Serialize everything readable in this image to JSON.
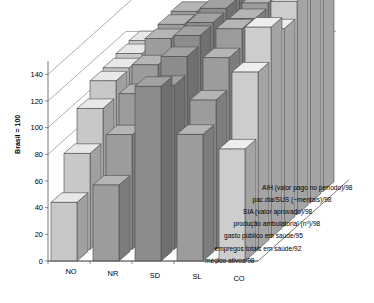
{
  "chart_data": {
    "type": "bar",
    "title": "",
    "subtitle": "",
    "xlabel": "",
    "ylabel": "Brasil = 100",
    "ylim": [
      0,
      150
    ],
    "yticks": [
      0,
      20,
      40,
      60,
      80,
      100,
      120,
      140
    ],
    "grid": true,
    "projection": "3d",
    "legend_position": "right-depth-axis",
    "categories": [
      "NO",
      "NR",
      "SD",
      "SL",
      "CO"
    ],
    "series": [
      {
        "name": "médico ativos/98",
        "values": [
          44,
          57,
          131,
          95,
          84
        ]
      },
      {
        "name": "empregos totais em saúde/92",
        "values": [
          72,
          86,
          123,
          112,
          133
        ]
      },
      {
        "name": "gasto público em saúde/95",
        "values": [
          97,
          108,
          136,
          135,
          158
        ]
      },
      {
        "name": "produção ambulatorial (nº)/98",
        "values": [
          109,
          121,
          143,
          148,
          148
        ]
      },
      {
        "name": "SIA (valor aprovado)/98",
        "values": [
          110,
          132,
          144,
          147,
          160
        ]
      },
      {
        "name": "pac.dia/SUS (~mentais)/98",
        "values": [
          112,
          134,
          146,
          150,
          162
        ]
      },
      {
        "name": "AIH (valor pago no período)/98",
        "values": [
          113,
          135,
          147,
          152,
          163
        ]
      }
    ],
    "series_colors": [
      "#b8b8b8",
      "#cfcfcf",
      "#9a9a9a",
      "#c4c4c4",
      "#a8a8a8",
      "#8e8e8e",
      "#d4d4d4"
    ],
    "bar_colors_by_category": [
      "#c8c8c8",
      "#9c9c9c",
      "#8c8c8c",
      "#9c9c9c",
      "#cdcdcd"
    ]
  },
  "axis": {
    "y_title": "Brasil = 100",
    "y_ticks": [
      "0",
      "20",
      "40",
      "60",
      "80",
      "100",
      "120",
      "140"
    ],
    "x_ticks": [
      "NO",
      "NR",
      "SD",
      "SL",
      "CO"
    ]
  },
  "legend": {
    "items": [
      "AIH (valor pago no período)/98",
      "pac.dia/SUS (~mentais)/98",
      "SIA (valor aprovado)/98",
      "produção ambulatorial (nº)/98",
      "gasto público em saúde/95",
      "empregos totais em saúde/92",
      "médico ativos/98"
    ]
  }
}
